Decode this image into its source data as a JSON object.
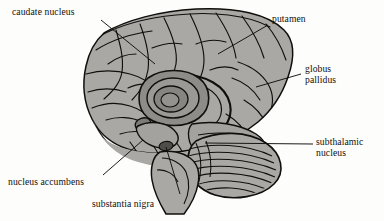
{
  "figure": {
    "background_color": "#fdfdfb",
    "ink_color": "#100f0d",
    "palette": {
      "cortex_fill": "#a9a8a4",
      "cortex_fill_light": "#b9b8b4",
      "deep_fill": "#8d8c88",
      "putamen_fill": "#9a9995",
      "pallidus_fill": "#868581",
      "nigra_fill": "#4e4d4a",
      "outline": "#100f0d"
    }
  },
  "labels": [
    {
      "id": "caudate-nucleus",
      "lines": [
        "caudate nucleus"
      ],
      "x": 12,
      "y": 6,
      "leader": "M101,20 L155,64"
    },
    {
      "id": "putamen",
      "lines": [
        "putamen"
      ],
      "x": 272,
      "y": 13,
      "leader": "M268,25 L218,54"
    },
    {
      "id": "globus-pallidus",
      "lines": [
        "globus",
        "pallidus"
      ],
      "x": 305,
      "y": 63,
      "leader": "M301,74 L256,87"
    },
    {
      "id": "subthalamic-nucleus",
      "lines": [
        "subthalamic",
        "nucleus"
      ],
      "x": 316,
      "y": 136,
      "leader": "M313,144 L205,143"
    },
    {
      "id": "nucleus-accumbens",
      "lines": [
        "nucleus accumbens"
      ],
      "x": 8,
      "y": 176,
      "leader": "M103,175 L143,140"
    },
    {
      "id": "substantia-nigra",
      "lines": [
        "substantia nigra"
      ],
      "x": 92,
      "y": 198,
      "leader": "M180,194 L166,147"
    }
  ],
  "structures": [
    {
      "id": "cerebral-cortex",
      "name": "cerebral cortex"
    },
    {
      "id": "caudate-head",
      "name": "caudate nucleus head"
    },
    {
      "id": "putamen-body",
      "name": "putamen"
    },
    {
      "id": "globus-pallidus-body",
      "name": "globus pallidus"
    },
    {
      "id": "subthalamic-nucleus-body",
      "name": "subthalamic nucleus"
    },
    {
      "id": "substantia-nigra-body",
      "name": "substantia nigra"
    },
    {
      "id": "nucleus-accumbens-body",
      "name": "nucleus accumbens"
    },
    {
      "id": "cerebellum",
      "name": "cerebellum"
    },
    {
      "id": "brainstem",
      "name": "brainstem"
    }
  ]
}
